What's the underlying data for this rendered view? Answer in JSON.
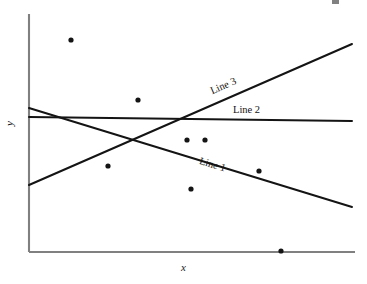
{
  "chart_data": {
    "type": "scatter",
    "title": "",
    "subtitle": "",
    "xlabel": "x",
    "ylabel": "y",
    "grid": false,
    "legend": false,
    "legend_position": "inline-labels",
    "axis_style": "open-L-frame",
    "xlim": [
      0,
      100
    ],
    "ylim": [
      0,
      100
    ],
    "xticks": [],
    "yticks": [],
    "xticklabels": [],
    "yticklabels": [],
    "points": {
      "name": "observations",
      "marker": "filled-circle",
      "color": "#141414",
      "count": 8,
      "x": [
        13,
        33,
        24,
        48,
        54,
        80,
        50,
        77
      ],
      "y": [
        89,
        64,
        36,
        47,
        47,
        35,
        26,
        0.5
      ]
    },
    "series": [
      {
        "name": "Line 1",
        "label": "Line 1",
        "type": "line",
        "direction": "decreasing",
        "color": "#141414",
        "x": [
          0,
          100
        ],
        "y": [
          60,
          19
        ]
      },
      {
        "name": "Line 2",
        "label": "Line 2",
        "type": "line",
        "direction": "flat",
        "color": "#141414",
        "x": [
          0,
          100
        ],
        "y": [
          57,
          55
        ]
      },
      {
        "name": "Line 3",
        "label": "Line 3",
        "type": "line",
        "direction": "increasing",
        "color": "#141414",
        "x": [
          0,
          100
        ],
        "y": [
          28,
          87
        ]
      }
    ],
    "annotations": [
      {
        "text": "Line 1",
        "rotation_deg": 17
      },
      {
        "text": "Line 2",
        "rotation_deg": 0
      },
      {
        "text": "Line 3",
        "rotation_deg": -24
      }
    ]
  },
  "figure": {
    "background_color": "#ffffff",
    "axis_color": "#808080",
    "data_color": "#141414"
  },
  "geometry": {
    "axes": {
      "origin_x": 29,
      "origin_y": 252,
      "y_top": 14,
      "x_right": 355
    },
    "lines": {
      "line_1": {
        "x1": 29,
        "y1": 108,
        "x2": 352,
        "y2": 207
      },
      "line_2": {
        "x1": 29,
        "y1": 117,
        "x2": 352,
        "y2": 121
      },
      "line_3": {
        "x1": 29,
        "y1": 185,
        "x2": 352,
        "y2": 44
      }
    },
    "points": [
      {
        "cx": 71,
        "cy": 40
      },
      {
        "cx": 138,
        "cy": 100
      },
      {
        "cx": 108,
        "cy": 166
      },
      {
        "cx": 187,
        "cy": 140
      },
      {
        "cx": 205,
        "cy": 140
      },
      {
        "cx": 259,
        "cy": 171
      },
      {
        "cx": 191,
        "cy": 189
      },
      {
        "cx": 281,
        "cy": 251
      }
    ]
  },
  "labels": {
    "x_axis": "x",
    "y_axis": "y",
    "line_1": "Line 1",
    "line_2": "Line 2",
    "line_3": "Line 3"
  }
}
